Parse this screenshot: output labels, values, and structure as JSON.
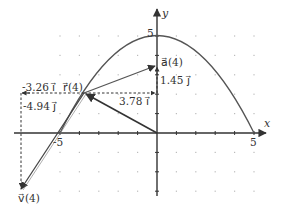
{
  "diagram": {
    "axes": {
      "x_label": "x",
      "y_label": "y",
      "x_tick_neg": "-5",
      "x_tick_pos": "5",
      "y_tick_pos": "5",
      "x_range": [
        -5,
        5
      ],
      "y_range": [
        -3,
        5
      ]
    },
    "curve": {
      "type": "parabola",
      "description": "y = 5 - x^2/5",
      "points": [
        [
          -5,
          0
        ],
        [
          0,
          5
        ],
        [
          5,
          0
        ]
      ]
    },
    "vectors": {
      "position": {
        "label": "r⃗(4)",
        "from": [
          0,
          0
        ],
        "to": [
          -3.78,
          2.14
        ]
      },
      "velocity": {
        "label": "v⃗(4)",
        "from": [
          -3.78,
          2.14
        ],
        "to": [
          -7.04,
          -2.8
        ]
      },
      "acceleration": {
        "label": "a⃗(4)",
        "from": [
          -3.78,
          2.14
        ],
        "to": [
          0,
          3.59
        ]
      }
    },
    "components": {
      "velocity_x": "-3.26 i⃗",
      "velocity_y": "-4.94 j⃗",
      "acceleration_x": "3.78 i⃗",
      "acceleration_y": "1.45 j⃗"
    },
    "colors": {
      "axis": "#333333",
      "curve": "#555555",
      "vector": "#444444",
      "dashed": "#333333",
      "grid_dot": "#bbbbbb"
    }
  }
}
